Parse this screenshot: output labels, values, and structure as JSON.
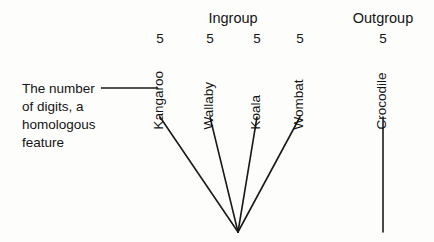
{
  "diagram": {
    "type": "cladogram",
    "groups": [
      {
        "label": "Ingroup",
        "x": 233,
        "y": 11
      },
      {
        "label": "Outgroup",
        "x": 383,
        "y": 11
      }
    ],
    "taxa": [
      {
        "name": "Kangaroo",
        "trait_value": "5",
        "x": 160,
        "label_bottom": 116,
        "tip_y": 117,
        "group": "Ingroup"
      },
      {
        "name": "Wallaby",
        "trait_value": "5",
        "x": 210,
        "label_bottom": 116,
        "tip_y": 117,
        "group": "Ingroup"
      },
      {
        "name": "Koala",
        "trait_value": "5",
        "x": 257,
        "label_bottom": 116,
        "tip_y": 117,
        "group": "Ingroup"
      },
      {
        "name": "Wombat",
        "trait_value": "5",
        "x": 300,
        "label_bottom": 116,
        "tip_y": 117,
        "group": "Ingroup"
      },
      {
        "name": "Crocodile",
        "trait_value": "5",
        "x": 383,
        "label_bottom": 116,
        "tip_y": 117,
        "group": "Outgroup"
      }
    ],
    "trait_row_y": 38,
    "node": {
      "x": 238,
      "y": 232
    },
    "outgroup_stem": {
      "x": 383,
      "y_top": 117,
      "y_bottom": 232
    },
    "annotation": {
      "line1": "The number",
      "line2": "of digits, a",
      "line3": "homologous",
      "line4": "feature",
      "leader": {
        "x1": 101,
        "x2": 158,
        "y": 88
      }
    },
    "colors": {
      "line": "#1a1a1a",
      "text": "#141414",
      "background": "#fdfdfc"
    }
  }
}
